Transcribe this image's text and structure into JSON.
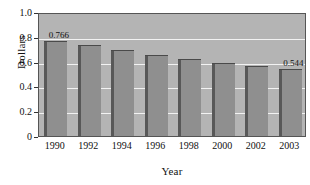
{
  "chart_data": {
    "type": "bar",
    "title": "",
    "xlabel": "Year",
    "ylabel": "Dollars",
    "categories": [
      "1990",
      "1992",
      "1994",
      "1996",
      "1998",
      "2000",
      "2002",
      "2003"
    ],
    "values": [
      0.766,
      0.735,
      0.695,
      0.655,
      0.62,
      0.588,
      0.565,
      0.544
    ],
    "value_labels": [
      {
        "category": "1990",
        "text": "0.766"
      },
      {
        "category": "2003",
        "text": "0.544"
      }
    ],
    "ylim": [
      0,
      1.0
    ],
    "ytick_labels": [
      "1.0",
      "0.8",
      "0.6",
      "0.4",
      "0.2",
      "0"
    ],
    "ytick_values": [
      1.0,
      0.8,
      0.6,
      0.4,
      0.2,
      0
    ],
    "grid": true,
    "grid_axis": "y",
    "legend": false,
    "colors": {
      "bar_fill": "#8f8f8f",
      "bar_shade": "#585858",
      "plot_background": "#b4b4b4",
      "gridline": "#f2f2f2",
      "axis": "#555555",
      "text": "#111111"
    }
  }
}
